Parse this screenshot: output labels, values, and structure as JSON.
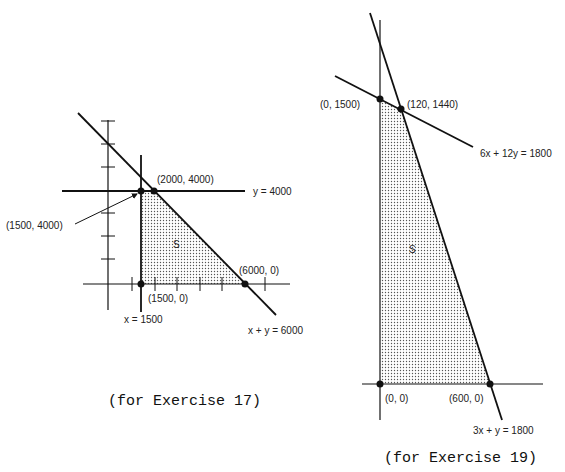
{
  "figures": [
    {
      "id": "exercise-17",
      "caption": "(for Exercise 17)",
      "region_label": "S",
      "constraints": [
        "y = 4000",
        "x = 1500",
        "x + y = 6000"
      ],
      "vertices": [
        {
          "label": "(2000, 4000)"
        },
        {
          "label": "(1500, 4000)"
        },
        {
          "label": "(6000, 0)"
        },
        {
          "label": "(1500, 0)"
        }
      ]
    },
    {
      "id": "exercise-19",
      "caption": "(for Exercise 19)",
      "region_label": "S",
      "constraints": [
        "6x + 12y = 1800",
        "3x + y = 1800"
      ],
      "vertices": [
        {
          "label": "(0, 1500)"
        },
        {
          "label": "(120, 1440)"
        },
        {
          "label": "(0, 0)"
        },
        {
          "label": "(600, 0)"
        }
      ]
    }
  ]
}
